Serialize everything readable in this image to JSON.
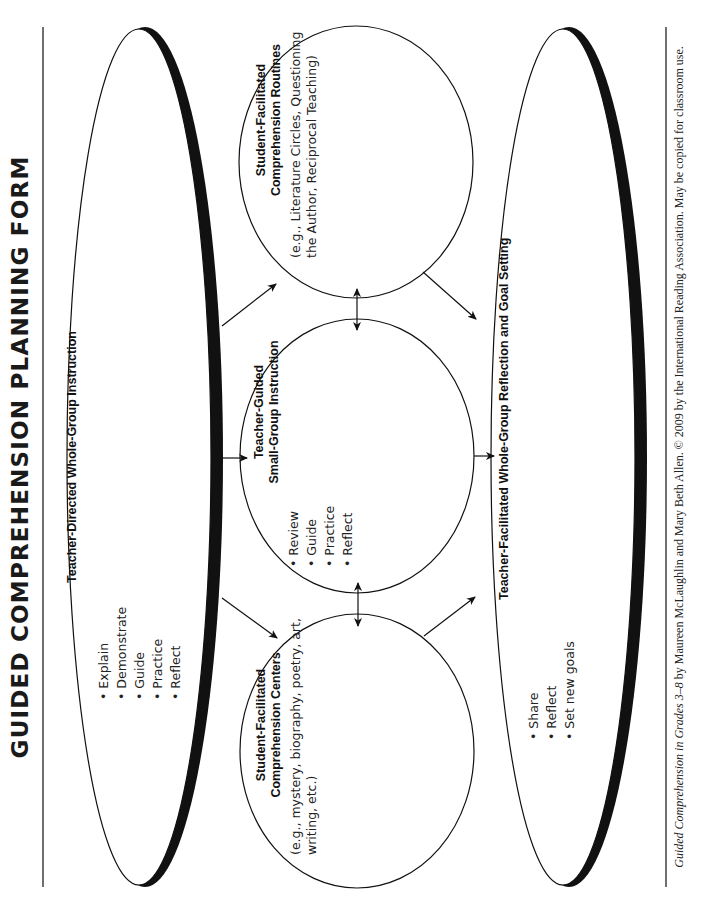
{
  "title": "GUIDED COMPREHENSION PLANNING FORM",
  "whole_group_instruction": {
    "heading": "Teacher-Directed Whole-Group Instruction",
    "items": [
      "• Explain",
      "• Demonstrate",
      "• Guide",
      "• Practice",
      "• Reflect"
    ]
  },
  "routines": {
    "heading_line1": "Student-Facilitated",
    "heading_line2": "Comprehension Routines",
    "desc_line1": "(e.g., Literature Circles, Questioning",
    "desc_line2": "the Author, Reciprocal Teaching)"
  },
  "small_group": {
    "heading_line1": "Teacher-Guided",
    "heading_line2": "Small-Group Instruction",
    "items": [
      "• Review",
      "• Guide",
      "• Practice",
      "• Reflect"
    ]
  },
  "centers": {
    "heading_line1": "Student-Facilitated",
    "heading_line2": "Comprehension Centers",
    "desc_line1": "(e.g., mystery, biography, poetry, art,",
    "desc_line2": "writing, etc.)"
  },
  "reflection": {
    "heading": "Teacher-Facilitated Whole-Group Reflection and Goal Setting",
    "items": [
      "• Share",
      "• Reflect",
      "• Set new goals"
    ]
  },
  "footer": {
    "book_title": "Guided Comprehension in Grades 3–8",
    "rest": " by Maureen McLaughlin and Mary Beth Allen. © 2009 by the International Reading Association. May be copied for classroom use."
  }
}
